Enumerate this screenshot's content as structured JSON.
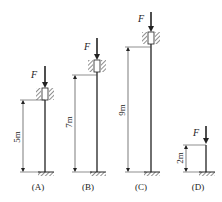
{
  "diagram": {
    "type": "column buckling comparison",
    "columns": [
      {
        "id": "A",
        "label": "(A)",
        "length": "5m",
        "load": "F",
        "top_support": "guided/sleeve",
        "base": "fixed"
      },
      {
        "id": "B",
        "label": "(B)",
        "length": "7m",
        "load": "F",
        "top_support": "guided/sleeve",
        "base": "fixed"
      },
      {
        "id": "C",
        "label": "(C)",
        "length": "9m",
        "load": "F",
        "top_support": "guided/sleeve",
        "base": "fixed"
      },
      {
        "id": "D",
        "label": "(D)",
        "length": "2m",
        "load": "F",
        "top_support": "free",
        "base": "fixed"
      }
    ],
    "colors": {
      "line": "#222222",
      "background": "#ffffff"
    }
  }
}
